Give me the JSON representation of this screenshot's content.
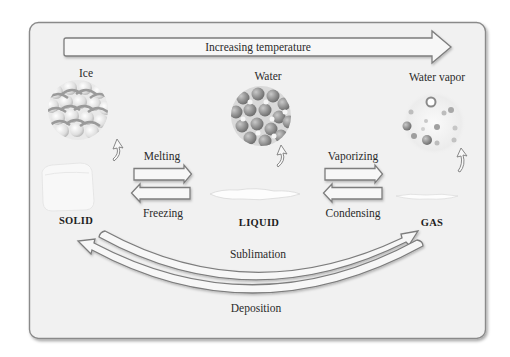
{
  "diagram": {
    "title_arrow": {
      "label": "Increasing temperature"
    },
    "phases": [
      {
        "id": "solid",
        "substance_label": "Ice",
        "state_label": "SOLID",
        "particle_style": "packed-lattice"
      },
      {
        "id": "liquid",
        "substance_label": "Water",
        "state_label": "LIQUID",
        "particle_style": "packed-disordered"
      },
      {
        "id": "gas",
        "substance_label": "Water vapor",
        "state_label": "GAS",
        "particle_style": "sparse"
      }
    ],
    "transitions": {
      "melting": {
        "label": "Melting",
        "from": "SOLID",
        "to": "LIQUID",
        "direction": "right"
      },
      "freezing": {
        "label": "Freezing",
        "from": "LIQUID",
        "to": "SOLID",
        "direction": "left"
      },
      "vaporizing": {
        "label": "Vaporizing",
        "from": "LIQUID",
        "to": "GAS",
        "direction": "right"
      },
      "condensing": {
        "label": "Condensing",
        "from": "GAS",
        "to": "LIQUID",
        "direction": "left"
      },
      "sublimation": {
        "label": "Sublimation",
        "from": "SOLID",
        "to": "GAS",
        "direction": "right"
      },
      "deposition": {
        "label": "Deposition",
        "from": "GAS",
        "to": "SOLID",
        "direction": "left"
      }
    },
    "colors": {
      "panel_fill": "#f1f1f1",
      "panel_border": "#8a8a8a",
      "arrow_fill": "#f7f7f7",
      "arrow_stroke": "#7d7d7d",
      "text": "#2b2b2b",
      "particle_dark": "#8c8c8c",
      "particle_light": "#e6e6e6"
    }
  }
}
